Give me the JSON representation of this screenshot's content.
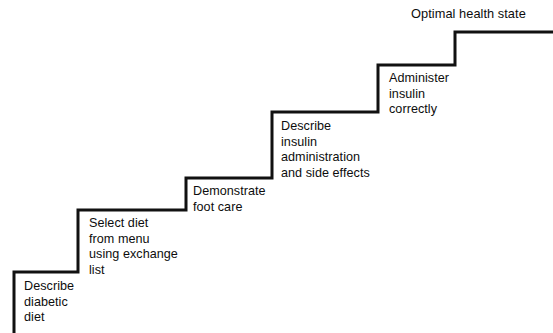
{
  "diagram": {
    "type": "staircase",
    "stroke_color": "#111111",
    "background_color": "#ffffff",
    "stroke_width": 3,
    "canvas": {
      "width": 553,
      "height": 333
    },
    "path": "M 14 333 L 14 272 L 78 272 L 78 210 L 186 210 L 186 178 L 272 178 L 272 112 L 378 112 L 378 65 L 455 65 L 455 32 L 553 32",
    "steps": [
      {
        "index": 1,
        "label": "Describe\ndiabetic\ndiet",
        "lines": [
          "Describe",
          "diabetic",
          "diet"
        ],
        "label_x": 24,
        "label_y": 279,
        "riser_x": 14,
        "tread_y": 272,
        "tread_x_start": 14,
        "tread_x_end": 78
      },
      {
        "index": 2,
        "label": "Select diet\nfrom menu\nusing exchange\nlist",
        "lines": [
          "Select diet",
          "from menu",
          "using exchange",
          "list"
        ],
        "label_x": 89,
        "label_y": 216,
        "riser_x": 78,
        "tread_y": 210,
        "tread_x_start": 78,
        "tread_x_end": 186
      },
      {
        "index": 3,
        "label": "Demonstrate\nfoot care",
        "lines": [
          "Demonstrate",
          "foot care"
        ],
        "label_x": 193,
        "label_y": 184,
        "riser_x": 186,
        "tread_y": 178,
        "tread_x_start": 186,
        "tread_x_end": 272
      },
      {
        "index": 4,
        "label": "Describe\ninsulin\nadministration\nand side effects",
        "lines": [
          "Describe",
          "insulin",
          "administration",
          "and side effects"
        ],
        "label_x": 281,
        "label_y": 119,
        "riser_x": 272,
        "tread_y": 112,
        "tread_x_start": 272,
        "tread_x_end": 378
      },
      {
        "index": 5,
        "label": "Administer\ninsulin\ncorrectly",
        "lines": [
          "Administer",
          "insulin",
          "correctly"
        ],
        "label_x": 389,
        "label_y": 71,
        "riser_x": 378,
        "tread_y": 65,
        "tread_x_start": 378,
        "tread_x_end": 455
      },
      {
        "index": 6,
        "label": "Optimal health state",
        "lines": [
          "Optimal health state"
        ],
        "label_x": 411,
        "label_y": 6,
        "riser_x": 455,
        "tread_y": 32,
        "tread_x_start": 455,
        "tread_x_end": 553
      }
    ]
  }
}
